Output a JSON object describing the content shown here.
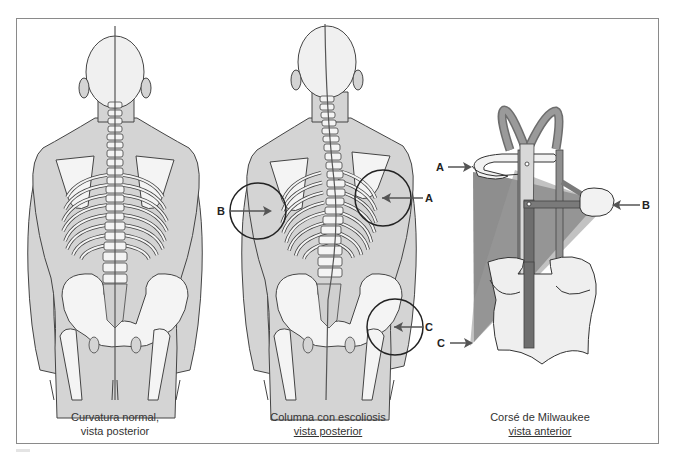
{
  "figure": {
    "panels": [
      {
        "id": "normal",
        "caption_line1": "Curvatura normal,",
        "caption_line2": "vista posterior"
      },
      {
        "id": "scoliosis",
        "caption_line1": "Columna con escoliosis",
        "caption_line2": "vista posterior",
        "markers": {
          "a": "A",
          "b": "B",
          "c": "C"
        }
      },
      {
        "id": "milwaukee",
        "caption_line1": "Corsé de Milwaukee",
        "caption_line2": "vista anterior",
        "markers": {
          "a": "A",
          "b": "B",
          "c": "C"
        }
      }
    ],
    "colors": {
      "skin": "#d4d4d4",
      "bone": "#f4f4f4",
      "outline": "#444444",
      "brace_strap": "#8f8f8f",
      "brace_bar": "#6e6e6e",
      "force_zone": "#7a7a7a"
    }
  }
}
